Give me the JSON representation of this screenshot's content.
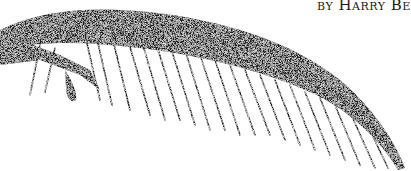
{
  "illustration": {
    "subject": "stippled palm frond",
    "ink_color": "#1e1e1e",
    "background_color": "#ffffff"
  },
  "byline": {
    "text": "by Harry Be"
  }
}
